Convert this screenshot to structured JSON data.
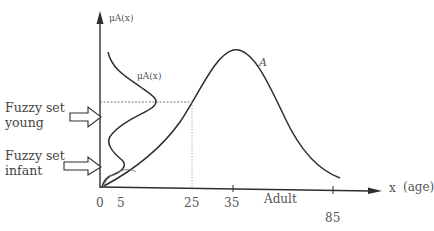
{
  "diagram": {
    "y_axis_label": "μA(x)",
    "inner_curve_label": "μA(x)",
    "curve_label": "A",
    "x_axis_label": "x",
    "x_unit_label": "(age)",
    "x_ticks": [
      "0",
      "5",
      "25",
      "35",
      "85"
    ],
    "region_label": "Adult",
    "side_labels": [
      {
        "line1": "Fuzzy set",
        "line2": "young"
      },
      {
        "line1": "Fuzzy set",
        "line2": "infant"
      }
    ],
    "colors": {
      "line": "#2e2e2e",
      "dotted": "#777777",
      "text": "#444444"
    }
  }
}
